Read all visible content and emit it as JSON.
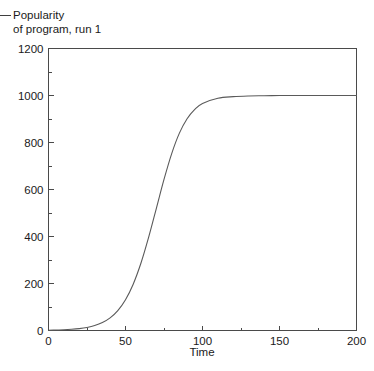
{
  "legend": {
    "marker": "line-marker",
    "line_1": "Popularity",
    "line_2": "of program, run 1"
  },
  "chart_data": {
    "type": "line",
    "title": "",
    "subtitle": "",
    "xlabel": "Time",
    "ylabel": "",
    "xlim": [
      0,
      200
    ],
    "ylim": [
      0,
      1200
    ],
    "grid": false,
    "legend_position": "above-plot-left",
    "x_ticks": [
      0,
      50,
      100,
      150,
      200
    ],
    "x_tick_labels": [
      "0",
      "50",
      "100",
      "150",
      "200"
    ],
    "x_minor_step": 25,
    "y_ticks": [
      0,
      200,
      400,
      600,
      800,
      1000,
      1200
    ],
    "y_tick_labels": [
      "0",
      "200",
      "400",
      "600",
      "800",
      "1000",
      "1200"
    ],
    "y_minor_step": 100,
    "series": [
      {
        "name": "Popularity of program, run 1",
        "color": "#5a5a5a",
        "x": [
          0,
          5,
          10,
          15,
          20,
          25,
          30,
          35,
          40,
          45,
          50,
          55,
          60,
          65,
          70,
          75,
          80,
          85,
          90,
          95,
          100,
          110,
          120,
          130,
          140,
          150,
          160,
          170,
          180,
          190,
          200
        ],
        "values": [
          1,
          2,
          3,
          5,
          8,
          13,
          21,
          34,
          54,
          85,
          131,
          197,
          286,
          396,
          519,
          643,
          753,
          840,
          901,
          941,
          966,
          988,
          995,
          998,
          999,
          1000,
          1000,
          1000,
          1000,
          1000,
          1000
        ]
      }
    ]
  }
}
